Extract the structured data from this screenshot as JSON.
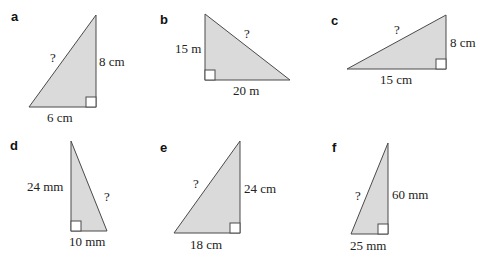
{
  "problems": [
    {
      "label": "a",
      "hypotenuse": "?",
      "leg1": "8 cm",
      "leg2": "6 cm"
    },
    {
      "label": "b",
      "leg1": "15 m",
      "hypotenuse": "?",
      "leg2": "20 m"
    },
    {
      "label": "c",
      "hypotenuse": "?",
      "leg1": "8 cm",
      "leg2": "15 cm"
    },
    {
      "label": "d",
      "leg1": "24 mm",
      "hypotenuse": "?",
      "leg2": "10 mm"
    },
    {
      "label": "e",
      "hypotenuse": "?",
      "leg1": "24 cm",
      "leg2": "18 cm"
    },
    {
      "label": "f",
      "hypotenuse": "?",
      "leg1": "60 mm",
      "leg2": "25 mm"
    }
  ],
  "colors": {
    "fill": "#dadada",
    "stroke": "#4a4a4a"
  }
}
